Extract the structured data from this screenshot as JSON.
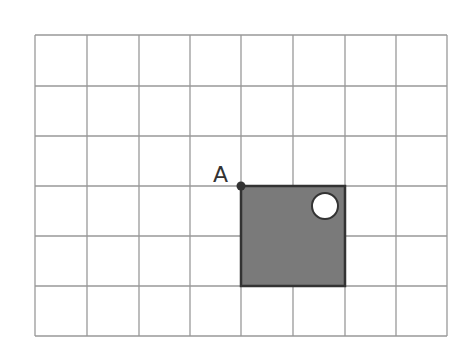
{
  "diagram": {
    "type": "grid-figure",
    "grid": {
      "columns": 8,
      "rows": 6,
      "x_lines": [
        35,
        87,
        139,
        190,
        241,
        293,
        345,
        396,
        447
      ],
      "y_lines": [
        35,
        86,
        136,
        186,
        236,
        286,
        336
      ],
      "line_color": "#999999",
      "background": "#ffffff"
    },
    "square": {
      "col_start": 4,
      "row_start": 3,
      "size_cells": 2,
      "fill": "#7a7a7a",
      "stroke": "#333333"
    },
    "hole": {
      "cx": 325,
      "cy": 206,
      "r": 13,
      "fill": "#ffffff",
      "stroke": "#333333"
    },
    "point_A": {
      "label": "A",
      "col": 4,
      "row": 3,
      "color": "#333333"
    }
  }
}
